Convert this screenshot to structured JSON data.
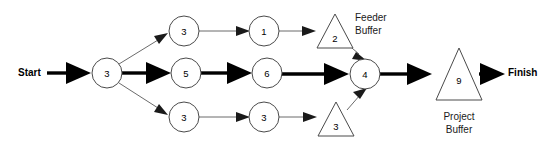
{
  "diagram": {
    "type": "critical-chain-project-network",
    "endpoints": {
      "start_label": "Start",
      "finish_label": "Finish"
    },
    "captions": {
      "feeder_buffer": "Feeder\nBuffer",
      "feeder_buffer_line1": "Feeder",
      "feeder_buffer_line2": "Buffer",
      "project_buffer": "Project\nBuffer",
      "project_buffer_line1": "Project",
      "project_buffer_line2": "Buffer"
    },
    "colors": {
      "background": "#ffffff",
      "node_stroke": "#4a4a4a",
      "thin_edge": "#6b6b6b",
      "thick_edge": "#000000",
      "text": "#000000"
    },
    "nodes": [
      {
        "id": "n-start-3",
        "label": "3",
        "shape": "circle",
        "cx": 107,
        "cy": 73,
        "r": 15,
        "row": "middle"
      },
      {
        "id": "n-top-3",
        "label": "3",
        "shape": "circle",
        "cx": 184,
        "cy": 31,
        "r": 15,
        "row": "top"
      },
      {
        "id": "n-top-1",
        "label": "1",
        "shape": "circle",
        "cx": 264,
        "cy": 31,
        "r": 15,
        "row": "top"
      },
      {
        "id": "n-mid-5",
        "label": "5",
        "shape": "circle",
        "cx": 186,
        "cy": 73,
        "r": 15,
        "row": "middle"
      },
      {
        "id": "n-mid-6",
        "label": "6",
        "shape": "circle",
        "cx": 267,
        "cy": 73,
        "r": 15,
        "row": "middle"
      },
      {
        "id": "n-bot-3a",
        "label": "3",
        "shape": "circle",
        "cx": 184,
        "cy": 117,
        "r": 15,
        "row": "bottom"
      },
      {
        "id": "n-bot-3b",
        "label": "3",
        "shape": "circle",
        "cx": 264,
        "cy": 117,
        "r": 15,
        "row": "bottom"
      },
      {
        "id": "n-merge-4",
        "label": "4",
        "shape": "circle",
        "cx": 365,
        "cy": 74,
        "r": 15,
        "row": "middle"
      },
      {
        "id": "t-feeder-2",
        "label": "2",
        "shape": "triangle",
        "cx": 335,
        "cy": 34,
        "half_width": 18,
        "height": 34,
        "row": "top"
      },
      {
        "id": "t-feeder-3",
        "label": "3",
        "shape": "triangle",
        "cx": 336,
        "cy": 122,
        "half_width": 18,
        "height": 34,
        "row": "bottom"
      },
      {
        "id": "t-project-9",
        "label": "9",
        "shape": "triangle",
        "cx": 459,
        "cy": 79,
        "half_width": 23,
        "height": 52,
        "row": "middle"
      }
    ],
    "edges": [
      {
        "id": "e-start-to-3",
        "from": "Start",
        "to": "n-start-3",
        "weight": "thick"
      },
      {
        "id": "e-3-to-top3",
        "from": "n-start-3",
        "to": "n-top-3",
        "weight": "thin"
      },
      {
        "id": "e-3-to-mid5",
        "from": "n-start-3",
        "to": "n-mid-5",
        "weight": "thick"
      },
      {
        "id": "e-3-to-bot3",
        "from": "n-start-3",
        "to": "n-bot-3a",
        "weight": "thin"
      },
      {
        "id": "e-top3-to-1",
        "from": "n-top-3",
        "to": "n-top-1",
        "weight": "thin"
      },
      {
        "id": "e-top1-to-fb2",
        "from": "n-top-1",
        "to": "t-feeder-2",
        "weight": "thin"
      },
      {
        "id": "e-fb2-to-4",
        "from": "t-feeder-2",
        "to": "n-merge-4",
        "weight": "thin"
      },
      {
        "id": "e-mid5-to-6",
        "from": "n-mid-5",
        "to": "n-mid-6",
        "weight": "thick"
      },
      {
        "id": "e-mid6-to-4",
        "from": "n-mid-6",
        "to": "n-merge-4",
        "weight": "thick"
      },
      {
        "id": "e-bot3a-to-3b",
        "from": "n-bot-3a",
        "to": "n-bot-3b",
        "weight": "thin"
      },
      {
        "id": "e-bot3b-to-fb3",
        "from": "n-bot-3b",
        "to": "t-feeder-3",
        "weight": "thin"
      },
      {
        "id": "e-fb3-to-4",
        "from": "t-feeder-3",
        "to": "n-merge-4",
        "weight": "thin"
      },
      {
        "id": "e-4-to-pb9",
        "from": "n-merge-4",
        "to": "t-project-9",
        "weight": "thick"
      },
      {
        "id": "e-pb9-to-finish",
        "from": "t-project-9",
        "to": "Finish",
        "weight": "thick"
      }
    ]
  }
}
